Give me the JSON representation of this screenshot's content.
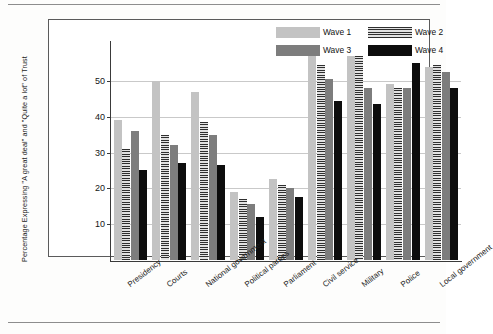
{
  "chart_data": {
    "type": "bar",
    "title": "",
    "xlabel": "",
    "ylabel": "Percentage Expressing \"A great deal\" and \"Quite a lot\" of Trust",
    "ylim": [
      0,
      60
    ],
    "yticks": [
      10,
      20,
      30,
      40,
      50
    ],
    "grid": true,
    "legend_position": "top-right",
    "categories": [
      "Presidency",
      "Courts",
      "National government",
      "Political parties",
      "Parliament",
      "Civil service",
      "Military",
      "Police",
      "Local government"
    ],
    "series": [
      {
        "name": "Wave 1",
        "color": "#c3c3c3",
        "pattern": "solid-light",
        "values": [
          39,
          50,
          47,
          19,
          22.5,
          57,
          57,
          49,
          54
        ]
      },
      {
        "name": "Wave 2",
        "color": "#a8a8a8",
        "pattern": "horizontal-stripes",
        "values": [
          31,
          35,
          38.5,
          17,
          21,
          54.5,
          57,
          48,
          54.5
        ]
      },
      {
        "name": "Wave 3",
        "color": "#7d7d7d",
        "pattern": "solid-medium",
        "values": [
          36,
          32,
          35,
          15.5,
          20,
          50.5,
          48,
          48,
          52.5
        ]
      },
      {
        "name": "Wave 4",
        "color": "#0d0d0d",
        "pattern": "solid-black",
        "values": [
          25,
          27,
          26.5,
          12,
          17.5,
          44.5,
          43.5,
          55,
          48
        ]
      }
    ]
  },
  "legend": {
    "entries": [
      {
        "label": "Wave 1"
      },
      {
        "label": "Wave 2"
      },
      {
        "label": "Wave 3"
      },
      {
        "label": "Wave 4"
      }
    ]
  }
}
